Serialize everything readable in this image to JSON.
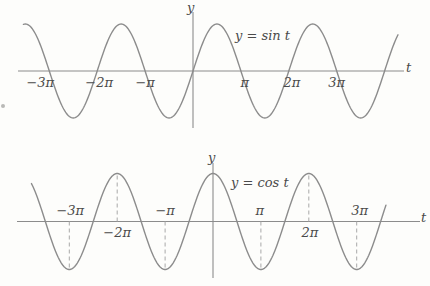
{
  "figure_title": "Graphs of the sine and cosine functions",
  "colors": {
    "background": "#fdfdfb",
    "curve": "#8c8c8c",
    "axis": "#8c8c8c",
    "dashed_guide": "#a8a8a8",
    "text": "#4a4a4a"
  },
  "chart_data": [
    {
      "type": "line",
      "function": "sin",
      "title": "y = sin t",
      "xlabel": "t",
      "ylabel": "y",
      "amplitude": 1,
      "period_pi": 2,
      "ylim": [
        -1,
        1
      ],
      "x_domain_pi": [
        -3.54,
        4.28
      ],
      "xticks_pi": [
        -3,
        -2,
        -1,
        1,
        2,
        3
      ],
      "xtick_labels": [
        "−3π",
        "−2π",
        "−π",
        "π",
        "2π",
        "3π"
      ],
      "tick_label_side": [
        "below",
        "below",
        "below",
        "below",
        "below",
        "below"
      ],
      "dashed_guides_pi": [],
      "key_points": {
        "zeros_pi": [
          -3,
          -2,
          -1,
          0,
          1,
          2,
          3,
          4
        ],
        "maxima_pi": [
          -3.5,
          -1.5,
          0.5,
          2.5
        ],
        "minima_pi": [
          -2.5,
          -0.5,
          1.5,
          3.5
        ]
      },
      "grid": "off",
      "legend": "none"
    },
    {
      "type": "line",
      "function": "cos",
      "title": "y = cos t",
      "xlabel": "t",
      "ylabel": "y",
      "amplitude": 1,
      "period_pi": 2,
      "ylim": [
        -1,
        1
      ],
      "x_domain_pi": [
        -3.79,
        3.63
      ],
      "xticks_pi": [
        -3,
        -2,
        -1,
        1,
        2,
        3
      ],
      "xtick_labels": [
        "−3π",
        "−2π",
        "−π",
        "π",
        "2π",
        "3π"
      ],
      "tick_label_side": [
        "above",
        "below",
        "above",
        "above",
        "below",
        "above"
      ],
      "dashed_guides_pi": [
        -3,
        -2,
        -1,
        1,
        2,
        3
      ],
      "key_points": {
        "zeros_pi": [
          -3.5,
          -2.5,
          -1.5,
          -0.5,
          0.5,
          1.5,
          2.5,
          3.5
        ],
        "maxima_pi": [
          -2,
          0,
          2
        ],
        "minima_pi": [
          -3,
          -1,
          1,
          3
        ]
      },
      "grid": "off",
      "legend": "none"
    }
  ]
}
